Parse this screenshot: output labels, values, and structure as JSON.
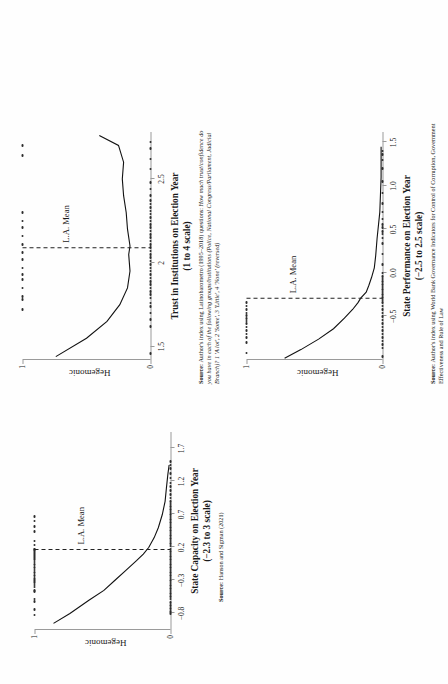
{
  "figure": {
    "type": "multi-panel-scatter-logit",
    "panels": 3,
    "page_rotation_degrees": -90
  },
  "chart_data": [
    {
      "id": "state-capacity",
      "type": "scatter",
      "title": "State Capacity on Election Year",
      "subtitle": "(−2.3 to 3 scale)",
      "xlabel": "State Capacity on Election Year",
      "ylabel": "Hegemonic",
      "xlim": [
        -1.05,
        1.95
      ],
      "ylim": [
        0,
        1
      ],
      "xticks": [
        "−0.8",
        "−0.3",
        "0.2",
        "0.7",
        "1.2",
        "1.7"
      ],
      "xtickvalues": [
        -0.8,
        -0.3,
        0.2,
        0.7,
        1.2,
        1.7
      ],
      "yticks": [
        "0",
        "1"
      ],
      "ytickvalues": [
        0,
        1
      ],
      "grid": false,
      "legend": null,
      "annotation": "L.A. Mean",
      "mean_x": 0.17,
      "source_prefix": "Source:",
      "source_text": "Hanson and Sigman (2021)",
      "series": [
        {
          "name": "Hegemonic = 1",
          "values_x": [
            -0.82,
            -0.74,
            -0.62,
            -0.58,
            -0.47,
            -0.45,
            -0.4,
            -0.37,
            -0.33,
            -0.3,
            -0.27,
            -0.22,
            -0.18,
            -0.14,
            -0.1,
            -0.06,
            -0.02,
            0.02,
            0.05,
            0.08,
            0.11,
            0.14,
            0.16,
            0.17,
            0.18,
            0.24,
            0.3,
            0.44,
            0.52,
            0.6,
            0.67
          ],
          "values_y": 1
        },
        {
          "name": "Hegemonic = 0",
          "values_x": [
            -0.8,
            -0.77,
            -0.72,
            -0.68,
            -0.63,
            -0.58,
            -0.54,
            -0.5,
            -0.46,
            -0.42,
            -0.38,
            -0.34,
            -0.3,
            -0.26,
            -0.22,
            -0.18,
            -0.14,
            -0.1,
            -0.06,
            -0.02,
            0.02,
            0.06,
            0.1,
            0.14,
            0.18,
            0.22,
            0.26,
            0.3,
            0.34,
            0.38,
            0.42,
            0.46,
            0.5,
            0.54,
            0.58,
            0.62,
            0.66,
            0.7,
            0.74,
            0.78,
            0.82,
            0.86,
            0.9,
            0.95,
            1.0,
            1.06,
            1.12,
            1.18,
            1.25,
            1.32,
            1.4,
            1.45,
            1.5
          ],
          "values_y": 0
        }
      ],
      "fit_curve": {
        "name": "local polynomial fit",
        "x": [
          -0.95,
          -0.8,
          -0.6,
          -0.45,
          -0.3,
          -0.15,
          0.0,
          0.1,
          0.2,
          0.35,
          0.5,
          0.7,
          0.9,
          1.1,
          1.3,
          1.45
        ],
        "y": [
          0.86,
          0.74,
          0.6,
          0.49,
          0.41,
          0.33,
          0.25,
          0.2,
          0.16,
          0.12,
          0.09,
          0.06,
          0.04,
          0.03,
          0.02,
          0.01
        ]
      }
    },
    {
      "id": "trust-institutions",
      "type": "scatter",
      "title": "Trust in Institutions on Election Year",
      "subtitle": "(1 to 4 scale)",
      "xlabel": "Trust in Institutions on Election Year",
      "ylabel": "Hegemonic",
      "xlim": [
        1.42,
        2.78
      ],
      "ylim": [
        0,
        1
      ],
      "xticks": [
        "1.5",
        "2",
        "2.5"
      ],
      "xtickvalues": [
        1.5,
        2.0,
        2.5
      ],
      "yticks": [
        "0",
        "1"
      ],
      "ytickvalues": [
        0,
        1
      ],
      "grid": false,
      "legend": null,
      "annotation": "L.A. Mean",
      "mean_x": 2.09,
      "source_prefix": "Source:",
      "source_text": "Author's index using Latinobarometro (1995–2018) questions: ",
      "source_text_italic": "How much trust/confidence do you have in each of the following groups/institutions (Police, National Congress/Parliament, Judicial Branch)? 1 'A lot', 2 'Some', 3 'Little', 4 'None' (reversed)",
      "series": [
        {
          "name": "Hegemonic = 1",
          "values_x": [
            1.72,
            1.78,
            1.8,
            1.85,
            1.9,
            1.93,
            1.97,
            2.02,
            2.06,
            2.11,
            2.16,
            2.21,
            2.25,
            2.3,
            2.64,
            2.7
          ],
          "values_y": 1
        },
        {
          "name": "Hegemonic = 0",
          "values_x": [
            1.46,
            1.62,
            1.66,
            1.7,
            1.74,
            1.76,
            1.79,
            1.81,
            1.83,
            1.85,
            1.87,
            1.89,
            1.91,
            1.93,
            1.95,
            1.97,
            1.99,
            2.01,
            2.03,
            2.05,
            2.07,
            2.09,
            2.11,
            2.13,
            2.15,
            2.17,
            2.19,
            2.21,
            2.23,
            2.25,
            2.27,
            2.29,
            2.31,
            2.33,
            2.35,
            2.37,
            2.4,
            2.44,
            2.48,
            2.56,
            2.62,
            2.68,
            2.72
          ],
          "values_y": 0
        }
      ],
      "fit_curve": {
        "name": "local polynomial fit",
        "x": [
          1.44,
          1.55,
          1.65,
          1.75,
          1.85,
          1.95,
          2.05,
          2.1,
          2.2,
          2.3,
          2.4,
          2.5,
          2.6,
          2.7,
          2.76
        ],
        "y": [
          0.74,
          0.5,
          0.34,
          0.24,
          0.18,
          0.16,
          0.17,
          0.16,
          0.18,
          0.19,
          0.21,
          0.22,
          0.21,
          0.25,
          0.4
        ]
      }
    },
    {
      "id": "state-performance",
      "type": "scatter",
      "title": "State Performance on Election Year",
      "subtitle": "(−2.5 to 2.5 scale)",
      "xlabel": "State Performance on Election Year",
      "ylabel": "Hegemonic",
      "xlim": [
        -1.0,
        1.62
      ],
      "ylim": [
        0,
        1
      ],
      "xticks": [
        "−0.5",
        "0.0",
        "0.5",
        "1.0",
        "1.5"
      ],
      "xtickvalues": [
        -0.5,
        0.0,
        0.5,
        1.0,
        1.5
      ],
      "yticks": [
        "0",
        "1"
      ],
      "ytickvalues": [
        0,
        1
      ],
      "grid": false,
      "legend": null,
      "annotation": "L.A. Mean",
      "mean_x": -0.29,
      "source_prefix": "Source:",
      "source_text": "Author's index using World Bank Governance Indicators for Control of Corruption, Government Effectiveness and Rule of Law",
      "series": [
        {
          "name": "Hegemonic = 1",
          "values_x": [
            -0.92,
            -0.8,
            -0.74,
            -0.7,
            -0.66,
            -0.62,
            -0.58,
            -0.55,
            -0.52,
            -0.49,
            -0.46,
            -0.42,
            -0.38,
            -0.34
          ],
          "values_y": 1
        },
        {
          "name": "Hegemonic = 0",
          "values_x": [
            -0.96,
            -0.86,
            -0.82,
            -0.78,
            -0.74,
            -0.7,
            -0.66,
            -0.62,
            -0.58,
            -0.54,
            -0.5,
            -0.46,
            -0.42,
            -0.38,
            -0.34,
            -0.31,
            -0.28,
            -0.25,
            -0.22,
            -0.19,
            -0.16,
            -0.13,
            -0.1,
            -0.07,
            -0.04,
            0.0,
            0.1,
            0.22,
            0.34,
            0.4,
            0.45,
            0.48,
            0.52,
            0.56,
            0.62,
            0.7,
            0.8,
            0.92,
            1.05,
            1.2,
            1.3,
            1.36,
            1.4
          ],
          "values_y": 0
        }
      ],
      "fit_curve": {
        "name": "local polynomial fit",
        "x": [
          -0.98,
          -0.88,
          -0.76,
          -0.64,
          -0.52,
          -0.42,
          -0.34,
          -0.29,
          -0.22,
          -0.14,
          -0.05,
          0.06,
          0.2,
          0.4,
          0.7,
          1.1,
          1.45
        ],
        "y": [
          0.72,
          0.6,
          0.47,
          0.36,
          0.28,
          0.22,
          0.18,
          0.16,
          0.12,
          0.1,
          0.08,
          0.06,
          0.05,
          0.04,
          0.02,
          0.01,
          0.01
        ]
      }
    }
  ]
}
